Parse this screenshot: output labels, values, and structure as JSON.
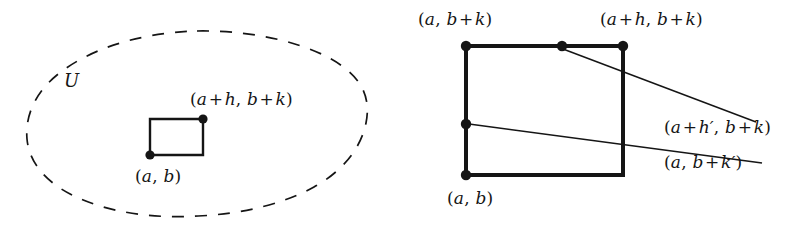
{
  "figure": {
    "width": 802,
    "height": 227,
    "background_color": "#ffffff",
    "stroke_color": "#151515",
    "type": "mathematical-diagram"
  },
  "left_panel": {
    "region_label": "U",
    "region_style": "dashed-closed-curve",
    "rectangle": {
      "corner_bottom_left_label": "(a, b)",
      "corner_top_right_label": "(a + h, b + k)"
    },
    "labels": {
      "region": "U",
      "bottom_left": {
        "open": "(",
        "a": "a",
        "comma": ",",
        "b": "b",
        "close": ")"
      },
      "top_right": {
        "open": "(",
        "a": "a",
        "plus1": "+",
        "h": "h",
        "comma": ",",
        "b": "b",
        "plus2": "+",
        "k": "k",
        "close": ")"
      }
    }
  },
  "right_panel": {
    "square_label_top_left": "(a, b + k)",
    "square_label_top_right": "(a + h, b + k)",
    "square_label_bottom_left": "(a, b)",
    "leader_label_upper": "(a + h', b + k)",
    "leader_label_lower": "(a, b + k')",
    "labels": {
      "top_left": {
        "open": "(",
        "a": "a",
        "comma": ",",
        "b": "b",
        "plus": "+",
        "k": "k",
        "close": ")"
      },
      "top_right": {
        "open": "(",
        "a": "a",
        "plus1": "+",
        "h": "h",
        "comma": ",",
        "b": "b",
        "plus2": "+",
        "k": "k",
        "close": ")"
      },
      "bottom_left": {
        "open": "(",
        "a": "a",
        "comma": ",",
        "b": "b",
        "close": ")"
      },
      "leader_upper": {
        "open": "(",
        "a": "a",
        "plus1": "+",
        "h": "h",
        "prime": "′",
        "comma": ",",
        "b": "b",
        "plus2": "+",
        "k": "k",
        "close": ")"
      },
      "leader_lower": {
        "open": "(",
        "a": "a",
        "comma": ",",
        "b": "b",
        "plus": "+",
        "k": "k",
        "prime": "′",
        "close": ")"
      }
    },
    "points": [
      {
        "name": "top-left-vertex",
        "label": "(a, b + k)"
      },
      {
        "name": "top-middle-point",
        "label": "(a + h', b + k)"
      },
      {
        "name": "top-right-vertex",
        "label": "(a + h, b + k)"
      },
      {
        "name": "left-middle-point",
        "label": "(a, b + k')"
      },
      {
        "name": "bottom-left-vertex",
        "label": "(a, b)"
      }
    ]
  }
}
